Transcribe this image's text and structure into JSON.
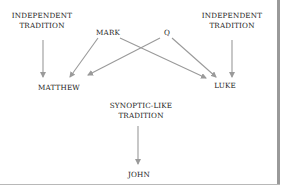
{
  "diagram": {
    "title": "",
    "nodes": {
      "independent_left": {
        "line1": "INDEPENDENT",
        "line2": "TRADITION"
      },
      "mark": {
        "label": "MARK"
      },
      "q": {
        "label": "Q"
      },
      "independent_right": {
        "line1": "INDEPENDENT",
        "line2": "TRADITION"
      },
      "matthew": {
        "label": "MATTHEW"
      },
      "luke": {
        "label": "LUKE"
      },
      "synoptic_like": {
        "line1": "SYNOPTIC-LIKE",
        "line2": "TRADITION"
      },
      "john": {
        "label": "JOHN"
      }
    },
    "edges": [
      {
        "from": "INDEPENDENT TRADITION (left)",
        "to": "MATTHEW"
      },
      {
        "from": "MARK",
        "to": "MATTHEW"
      },
      {
        "from": "Q",
        "to": "MATTHEW"
      },
      {
        "from": "MARK",
        "to": "LUKE"
      },
      {
        "from": "Q",
        "to": "LUKE"
      },
      {
        "from": "INDEPENDENT TRADITION (right)",
        "to": "LUKE"
      },
      {
        "from": "SYNOPTIC-LIKE TRADITION",
        "to": "JOHN"
      }
    ],
    "colors": {
      "arrow": "#9a9a9a",
      "text": "#222222",
      "border": "#9a9a9a",
      "background": "#ffffff"
    }
  }
}
